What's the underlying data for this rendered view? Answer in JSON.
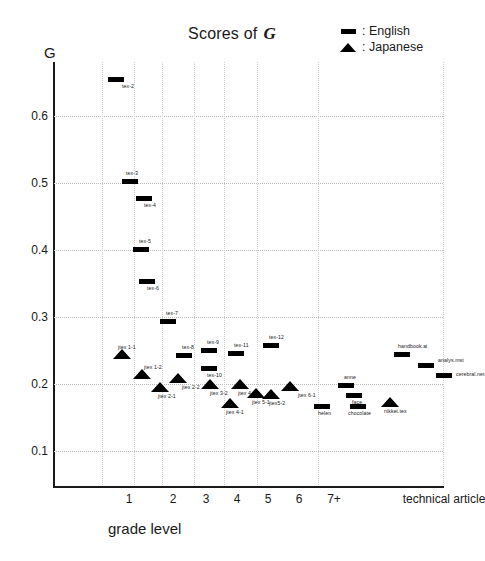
{
  "chart_data": {
    "type": "scatter",
    "title_symbol": "G",
    "ylabel": "G",
    "xlabel": "grade level",
    "ylim": [
      0.05,
      0.68
    ],
    "yticks": [
      0.6,
      0.5,
      0.4,
      0.3,
      0.2,
      0.1
    ],
    "ytick_labels": [
      "0.6",
      "0.5",
      "0.4",
      "0.3",
      "0.2",
      "0.1"
    ],
    "xtick_labels": [
      "1",
      "2",
      "3",
      "4",
      "5",
      "6",
      "7+",
      "technical article"
    ],
    "grid": true,
    "legend_position": "top-right",
    "legend": [
      {
        "label": "English",
        "marker": "bar-glyph"
      },
      {
        "label": "Japanese",
        "marker": "triangle-glyph"
      }
    ],
    "series": [
      {
        "name": "English",
        "marker": "bar",
        "points": [
          {
            "label": "tex-2",
            "x": 62,
            "y": 0.655,
            "lx": 6,
            "ly": 4
          },
          {
            "label": "tex-3",
            "x": 76,
            "y": 0.503,
            "lx": -4,
            "ly": -11
          },
          {
            "label": "tex-4",
            "x": 90,
            "y": 0.478,
            "lx": 0,
            "ly": 4
          },
          {
            "label": "tex-5",
            "x": 87,
            "y": 0.402,
            "lx": -2,
            "ly": -11
          },
          {
            "label": "tex-6",
            "x": 93,
            "y": 0.354,
            "lx": 0,
            "ly": 4
          },
          {
            "label": "tex-7",
            "x": 114,
            "y": 0.294,
            "lx": -2,
            "ly": -11
          },
          {
            "label": "tex-8",
            "x": 130,
            "y": 0.244,
            "lx": -2,
            "ly": -11
          },
          {
            "label": "tex-9",
            "x": 155,
            "y": 0.251,
            "lx": -2,
            "ly": -11
          },
          {
            "label": "tex-10",
            "x": 155,
            "y": 0.225,
            "lx": -2,
            "ly": 4
          },
          {
            "label": "tex-11",
            "x": 182,
            "y": 0.246,
            "lx": -2,
            "ly": -11
          },
          {
            "label": "tex-12",
            "x": 217,
            "y": 0.259,
            "lx": -2,
            "ly": -11
          },
          {
            "label": "helen",
            "x": 268,
            "y": 0.168,
            "lx": -4,
            "ly": 4
          },
          {
            "label": "anne",
            "x": 292,
            "y": 0.199,
            "lx": -2,
            "ly": -11
          },
          {
            "label": "face",
            "x": 300,
            "y": 0.184,
            "lx": -2,
            "ly": 4
          },
          {
            "label": "chocolate",
            "x": 304,
            "y": 0.168,
            "lx": -10,
            "ly": 4
          },
          {
            "label": "handbook.ai",
            "x": 348,
            "y": 0.245,
            "lx": -4,
            "ly": -11
          },
          {
            "label": "analys.mst",
            "x": 372,
            "y": 0.229,
            "lx": 12,
            "ly": -8
          },
          {
            "label": "cerebral.net",
            "x": 390,
            "y": 0.214,
            "lx": 12,
            "ly": -4
          }
        ]
      },
      {
        "name": "Japanese",
        "marker": "triangle",
        "points": [
          {
            "label": "jtex 1-1",
            "x": 68,
            "y": 0.239,
            "lx": -4,
            "ly": -14
          },
          {
            "label": "jtex 1-2",
            "x": 88,
            "y": 0.21,
            "lx": 2,
            "ly": -14
          },
          {
            "label": "jtex 2-1",
            "x": 106,
            "y": 0.19,
            "lx": -2,
            "ly": 2
          },
          {
            "label": "jtex 2-2",
            "x": 124,
            "y": 0.203,
            "lx": 4,
            "ly": 2
          },
          {
            "label": "jtex 3-2",
            "x": 156,
            "y": 0.194,
            "lx": 0,
            "ly": 2
          },
          {
            "label": "jtex 4-1",
            "x": 176,
            "y": 0.166,
            "lx": -4,
            "ly": 2
          },
          {
            "label": "jtex 4-2",
            "x": 186,
            "y": 0.195,
            "lx": -2,
            "ly": 2
          },
          {
            "label": "jtex 5-1",
            "x": 202,
            "y": 0.181,
            "lx": -4,
            "ly": 2
          },
          {
            "label": "jtex5-2",
            "x": 217,
            "y": 0.18,
            "lx": -2,
            "ly": 2
          },
          {
            "label": "jtex 6-1",
            "x": 236,
            "y": 0.192,
            "lx": 8,
            "ly": 2
          },
          {
            "label": "nikkei.tex",
            "x": 336,
            "y": 0.168,
            "lx": -6,
            "ly": 2
          }
        ]
      }
    ],
    "gridlines_v_px": [
      48,
      80,
      108,
      140,
      170,
      203,
      264,
      389
    ],
    "xtick_px": [
      75,
      119,
      152,
      183,
      214,
      245,
      280,
      390
    ]
  }
}
